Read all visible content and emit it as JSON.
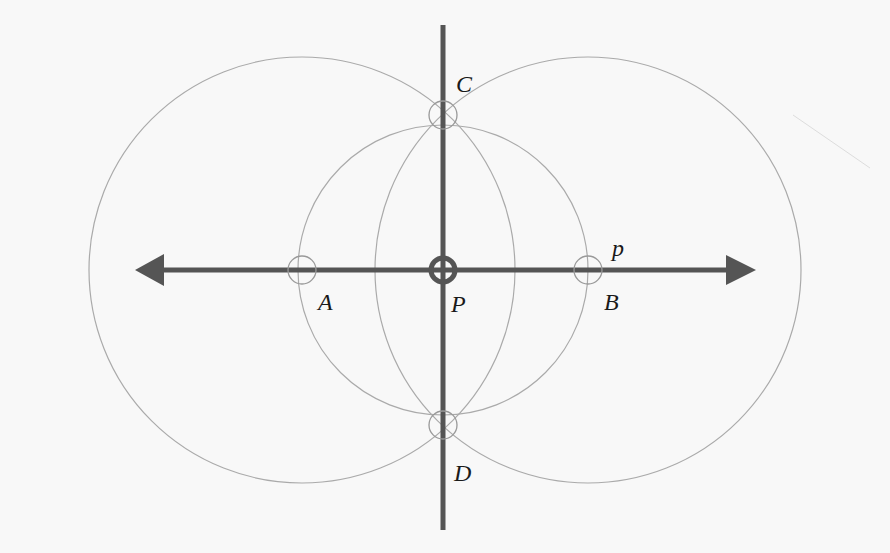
{
  "diagram": {
    "colors": {
      "background": "#f8f8f8",
      "line": "#555555",
      "arc": "#a8a8a8",
      "label": "#1a1a1a"
    },
    "line_p": {
      "label": "p",
      "y": 270,
      "x_start": 137,
      "x_end": 755
    },
    "perpendicular": {
      "x": 443,
      "y_start": 25,
      "y_end": 530
    },
    "points": [
      {
        "name": "A",
        "label": "A",
        "x": 302,
        "y": 270,
        "label_x": 318,
        "label_y": 290
      },
      {
        "name": "B",
        "label": "B",
        "x": 588,
        "y": 270,
        "label_x": 604,
        "label_y": 290
      },
      {
        "name": "P",
        "label": "P",
        "x": 443,
        "y": 270,
        "label_x": 451,
        "label_y": 292
      },
      {
        "name": "C",
        "label": "C",
        "x": 443,
        "y": 115,
        "label_x": 456,
        "label_y": 72
      },
      {
        "name": "D",
        "label": "D",
        "x": 443,
        "y": 425,
        "label_x": 454,
        "label_y": 461
      }
    ],
    "circles": [
      {
        "name": "circle-center-P",
        "cx": 443,
        "cy": 270,
        "r": 145
      },
      {
        "name": "circle-center-A",
        "cx": 302,
        "cy": 270,
        "r": 213
      },
      {
        "name": "circle-center-B",
        "cx": 588,
        "cy": 270,
        "r": 213
      }
    ],
    "labels": {
      "p": "p",
      "A": "A",
      "B": "B",
      "P": "P",
      "C": "C",
      "D": "D"
    }
  }
}
